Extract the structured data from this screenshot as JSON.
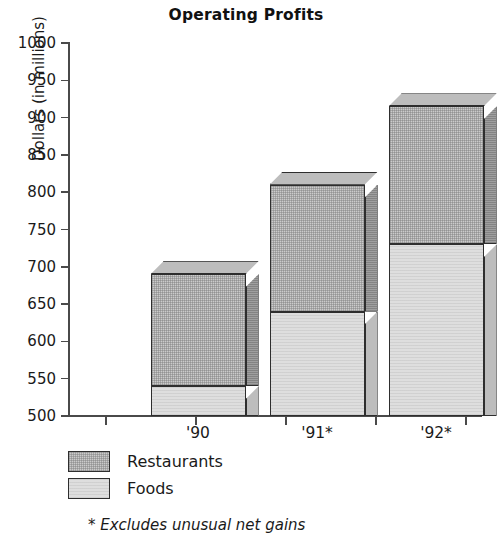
{
  "chart_data": {
    "type": "bar",
    "subtype": "stacked-bar-3d",
    "title": "Operating Profits",
    "xlabel": "",
    "ylabel": "Dollars (in millions)",
    "ylim": [
      500,
      1000
    ],
    "ytick_step": 50,
    "ytick_labels": [
      "1000",
      "950",
      "900",
      "850",
      "800",
      "750",
      "700",
      "650",
      "600",
      "550",
      "500"
    ],
    "ytick_values": [
      1000,
      950,
      900,
      850,
      800,
      750,
      700,
      650,
      600,
      550,
      500
    ],
    "grid": false,
    "legend_position": "below-axis-left",
    "categories": [
      "'90",
      "'91*",
      "'92*"
    ],
    "series": [
      {
        "name": "Foods",
        "values": [
          540,
          640,
          730
        ]
      },
      {
        "name": "Restaurants",
        "values": [
          150,
          170,
          185
        ]
      }
    ],
    "cumulative_tops": [
      690,
      810,
      915
    ],
    "annotations": [
      "* Excludes unusual net gains"
    ],
    "colors": {
      "restaurants": "#cbcbcb",
      "foods": "#dedede",
      "outline": "#2e2e2e",
      "axis": "#4a4a4a",
      "text": "#1a1a1a",
      "background": "#ffffff"
    }
  },
  "legend": {
    "items": [
      {
        "label": "Restaurants",
        "key": "restaurants"
      },
      {
        "label": "Foods",
        "key": "foods"
      }
    ]
  },
  "footnote": {
    "text": "* Excludes unusual net gains"
  }
}
